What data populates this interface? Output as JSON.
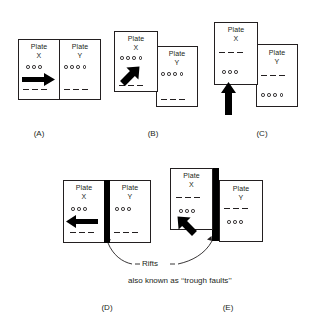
{
  "figure": {
    "line_color": "#231f20",
    "rift_color": "#000000",
    "background": "#ffffff"
  },
  "labels": {
    "plate_x": "Plate\nX",
    "plate_y": "Plate\nY"
  },
  "panels": [
    {
      "id": "A",
      "caption": "(A)",
      "description": "Two plates sharing a vertical boundary, Plate X moving right",
      "plate_x": {
        "circles": 3,
        "dashes": 3,
        "arrow": "right"
      },
      "plate_y": {
        "circles": 4,
        "dashes": 3,
        "arrow": "none"
      },
      "rift": false
    },
    {
      "id": "B",
      "caption": "(B)",
      "description": "Offset plates, Plate X moving up and to the right",
      "plate_x": {
        "circles": 4,
        "dashes": 3,
        "arrow": "up-right"
      },
      "plate_y": {
        "circles": 4,
        "dashes": 3,
        "arrow": "none"
      },
      "rift": false
    },
    {
      "id": "C",
      "caption": "(C)",
      "description": "Offset plates, Plate X moving straight up",
      "plate_x": {
        "circles": 3,
        "dashes": 3,
        "arrow": "up"
      },
      "plate_y": {
        "circles": 4,
        "dashes": 3,
        "arrow": "none"
      },
      "rift": false
    },
    {
      "id": "D",
      "caption": "(D)",
      "description": "Plates separated by a dark rift, Plate X moving left",
      "plate_x": {
        "circles": 3,
        "dashes": 3,
        "arrow": "left"
      },
      "plate_y": {
        "circles": 3,
        "dashes": 3,
        "arrow": "none"
      },
      "rift": true
    },
    {
      "id": "E",
      "caption": "(E)",
      "description": "Offset plates separated by a dark rift, Plate X moving up and to the left",
      "plate_x": {
        "circles": 3,
        "dashes": 3,
        "arrow": "up-left"
      },
      "plate_y": {
        "circles": 3,
        "dashes": 3,
        "arrow": "none"
      },
      "rift": true
    }
  ],
  "annotations": {
    "rifts_label": "Rifts",
    "trough_note": "also known as ‘‘trough faults’’"
  }
}
